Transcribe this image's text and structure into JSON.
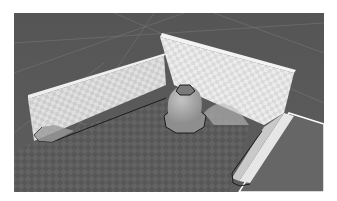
{
  "scene": {
    "type": "3d-viewport",
    "colors": {
      "page_background": "#ffffff",
      "ground": "#5a5a5a",
      "ground_dark": "#4a4a4a",
      "floor_pattern": "#626262",
      "floor_pattern_alt": "#555555",
      "wall_light": "#e2e2e2",
      "wall_mid": "#cfcfcf",
      "wall_top": "#f2f2f2",
      "wall_shadow": "#b8b8b8",
      "outline": "#1c1c1c",
      "grid_line": "#9a9a9a",
      "sphere": "#a8a8a8",
      "right_plane": "#6a6a6a"
    },
    "objects": [
      {
        "name": "left-wall"
      },
      {
        "name": "back-wall"
      },
      {
        "name": "right-wall-ramp"
      },
      {
        "name": "center-dome"
      },
      {
        "name": "floor-plane"
      },
      {
        "name": "right-floor-plane"
      }
    ]
  }
}
